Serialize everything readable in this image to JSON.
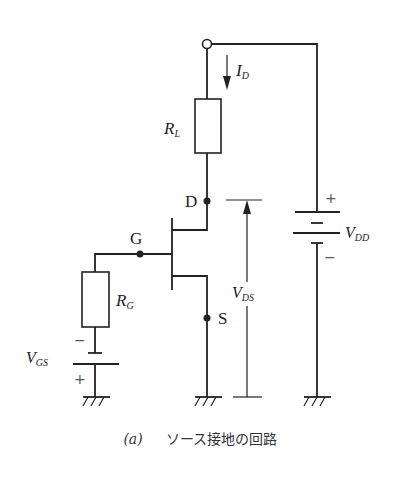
{
  "labels": {
    "current": {
      "main": "I",
      "sub": "D"
    },
    "load_resistor": {
      "main": "R",
      "sub": "L"
    },
    "gate_resistor": {
      "main": "R",
      "sub": "G"
    },
    "drain": "D",
    "gate": "G",
    "source": "S",
    "vds": {
      "main": "V",
      "sub": "DS"
    },
    "vdd": {
      "main": "V",
      "sub": "DD"
    },
    "vgs": {
      "main": "V",
      "sub": "GS"
    },
    "plus": "+",
    "minus": "−"
  },
  "caption": {
    "label": "(a)",
    "text": "ソース接地の回路"
  },
  "colors": {
    "line": "#222222",
    "background": "#ffffff"
  }
}
